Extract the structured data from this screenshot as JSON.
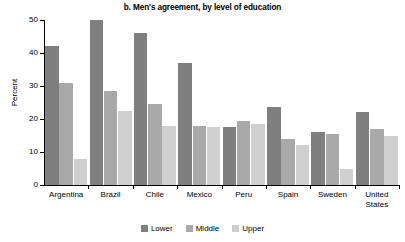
{
  "chart_data": {
    "type": "bar",
    "title": "b. Men's agreement, by level of education",
    "xlabel": "",
    "ylabel": "Percent",
    "ylim": [
      0,
      50
    ],
    "yticks": [
      0,
      10,
      20,
      30,
      40,
      50
    ],
    "ytick_labels": [
      "0",
      "10",
      "20",
      "30",
      "40",
      "50"
    ],
    "grid": false,
    "legend_position": "bottom-center",
    "categories": [
      "Argentina",
      "Brazil",
      "Chile",
      "Mexico",
      "Peru",
      "Spain",
      "Sweden",
      "United\nStates"
    ],
    "series": [
      {
        "name": "Lower",
        "color": "#7f7f7f",
        "values": [
          42,
          50,
          46,
          37,
          17.5,
          23.5,
          16,
          22
        ]
      },
      {
        "name": "Middle",
        "color": "#a9a9a9",
        "values": [
          31,
          28.5,
          24.5,
          18,
          19.5,
          14,
          15.5,
          17
        ]
      },
      {
        "name": "Upper",
        "color": "#cfcfcf",
        "values": [
          8,
          22.5,
          18,
          17.5,
          18.5,
          12,
          5,
          15
        ]
      }
    ]
  },
  "legend": {
    "items": [
      {
        "label": "Lower",
        "color": "#7f7f7f"
      },
      {
        "label": "Middle",
        "color": "#a9a9a9"
      },
      {
        "label": "Upper",
        "color": "#cfcfcf"
      }
    ]
  }
}
